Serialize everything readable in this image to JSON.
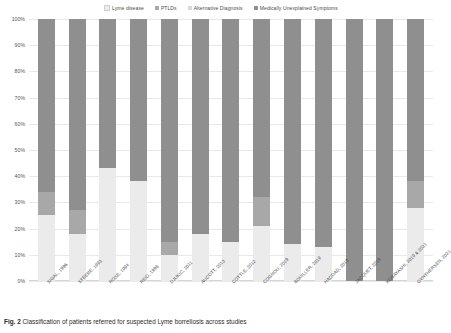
{
  "figure": {
    "caption_label": "Fig. 2",
    "caption_text": "Classification of patients referred for suspected Lyme borreliosis across studies"
  },
  "legend": {
    "position": "top",
    "items": [
      {
        "label": "Lyme disease",
        "color": "#ebebeb"
      },
      {
        "label": "PTLDs",
        "color": "#a8a8a8"
      },
      {
        "label": "Alternative Diagnosis",
        "color": "#d9d9d9"
      },
      {
        "label": "Medically Unexplained Symptoms",
        "color": "#8f8f8f"
      }
    ]
  },
  "axes": {
    "y_ticks": [
      "100%",
      "90%",
      "80%",
      "70%",
      "60%",
      "50%",
      "40%",
      "30%",
      "20%",
      "10%",
      "0%"
    ],
    "ylabel": "",
    "xlabel": "",
    "ylim": [
      0,
      100
    ],
    "grid": true
  },
  "chart_data": {
    "type": "bar",
    "title": "",
    "subtitle": "",
    "xlabel": "",
    "ylabel": "",
    "ylim": [
      0,
      100
    ],
    "grid": true,
    "stacked": true,
    "normalized_percent": true,
    "legend_position": "top",
    "categories": [
      "SIGAL, 1996",
      "STEERE, 1993",
      "ROSE, 1994",
      "REID, 1998",
      "DJUKIC, 2011",
      "AUCOTT, 2013",
      "COTTLE, 2012",
      "COGNOU, 2019",
      "BOUILLER, 2019",
      "HADDAD, 2019",
      "JACQUET, 2019",
      "KOBAYASHI, 2019 & 2021",
      "GYNTHERSEN, 2021"
    ],
    "series": [
      {
        "name": "Lyme disease",
        "color": "#ebebeb",
        "values": [
          25,
          18,
          43,
          38,
          10,
          18,
          15,
          21,
          14,
          13,
          0,
          0,
          28
        ]
      },
      {
        "name": "PTLDs",
        "color": "#a8a8a8",
        "values": [
          9,
          9,
          0,
          0,
          5,
          0,
          0,
          11,
          0,
          0,
          0,
          0,
          10
        ]
      },
      {
        "name": "Alternative Diagnosis",
        "color": "#d9d9d9",
        "values": [
          0,
          0,
          0,
          0,
          0,
          0,
          0,
          0,
          0,
          0,
          0,
          0,
          0
        ]
      },
      {
        "name": "Medically Unexplained Symptoms",
        "color": "#8f8f8f",
        "values": [
          66,
          73,
          57,
          62,
          85,
          82,
          85,
          68,
          86,
          87,
          100,
          100,
          62
        ]
      }
    ]
  }
}
